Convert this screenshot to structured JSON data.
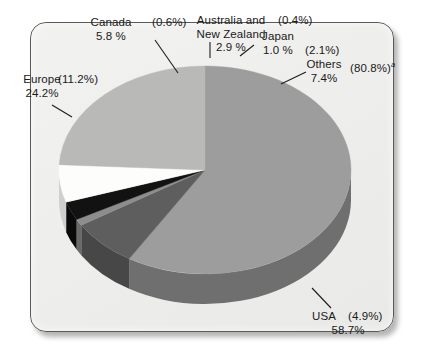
{
  "chart_data": {
    "type": "pie",
    "title": "",
    "subtitle": "",
    "xlabel": "",
    "ylabel": "",
    "legend_position": "callout-labels",
    "grid": false,
    "value_unit": "%",
    "note": "Each slice carries a primary share percentage and a secondary percentage shown in parentheses.",
    "categories": [
      "USA",
      "Others",
      "Japan",
      "Australia and New Zealand",
      "Canada",
      "Europe"
    ],
    "values": [
      58.7,
      7.4,
      1.0,
      2.9,
      5.8,
      24.2
    ],
    "secondary_values": [
      4.9,
      80.8,
      2.1,
      0.4,
      0.6,
      11.2
    ],
    "slices": [
      {
        "name": "USA",
        "label": "USA",
        "value": "58.7%",
        "value_num": 58.7,
        "paren": "(4.9%)",
        "paren_num": 4.9,
        "color": "#9d9d9d",
        "side_color": "#6f6f6f",
        "start_deg": 0,
        "sweep_deg": 211.32
      },
      {
        "name": "Others",
        "label": "Others",
        "value": "7.4%",
        "value_num": 7.4,
        "paren": "(80.8%)",
        "paren_num": 80.8,
        "footnote_marker": "a",
        "color": "#5e5e5e",
        "side_color": "#474747",
        "start_deg": 211.32,
        "sweep_deg": 26.64
      },
      {
        "name": "Japan",
        "label": "Japan",
        "value": "1.0 %",
        "value_num": 1.0,
        "paren": "(2.1%)",
        "paren_num": 2.1,
        "color": "#8d8d8d",
        "side_color": "#6a6a6a",
        "start_deg": 237.96,
        "sweep_deg": 3.6
      },
      {
        "name": "Australia and New Zealand",
        "label": "Australia and New Zealand",
        "label_line1": "Australia and",
        "label_line2": "New Zealand",
        "value": "2.9 %",
        "value_num": 2.9,
        "paren": "(0.4%)",
        "paren_num": 0.4,
        "color": "#121212",
        "side_color": "#0a0a0a",
        "start_deg": 241.56,
        "sweep_deg": 10.44
      },
      {
        "name": "Canada",
        "label": "Canada",
        "value": "5.8 %",
        "value_num": 5.8,
        "paren": "(0.6%)",
        "paren_num": 0.6,
        "color": "#fdfdfb",
        "side_color": "#cfcfcb",
        "start_deg": 252.0,
        "sweep_deg": 20.88
      },
      {
        "name": "Europe",
        "label": "Europe",
        "value": "24.2%",
        "value_num": 24.2,
        "paren": "(11.2%)",
        "paren_num": 11.2,
        "color": "#b9b9b7",
        "side_color": "#8a8a88",
        "start_deg": 272.88,
        "sweep_deg": 87.12
      }
    ]
  },
  "frame": {
    "background_color": "#efefed",
    "border_color": "#5a5a5a"
  },
  "labels": {
    "canada_name": "Canada",
    "canada_value": "5.8 %",
    "canada_paren": "(0.6%)",
    "anz_line1": "Australia and",
    "anz_line2": "New Zealand",
    "anz_value": "2.9 %",
    "anz_paren": "(0.4%)",
    "japan_name": "Japan",
    "japan_value": "1.0 %",
    "japan_paren": "(2.1%)",
    "others_name": "Others",
    "others_value": "7.4%",
    "others_paren": "(80.8%)",
    "others_footnote": "a",
    "europe_name": "Europe",
    "europe_value": "24.2%",
    "europe_paren": "(11.2%)",
    "usa_name": "USA",
    "usa_paren": "(4.9%)",
    "usa_value": "58.7%"
  }
}
